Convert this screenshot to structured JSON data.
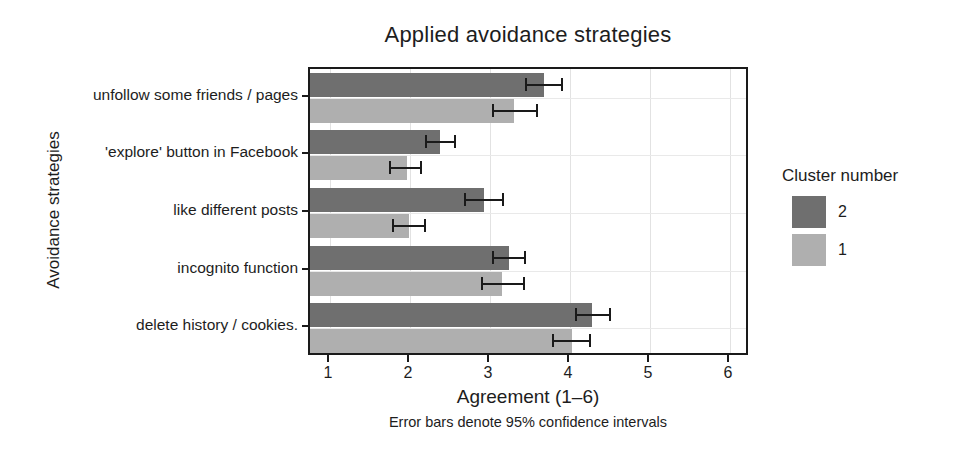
{
  "chart_data": {
    "type": "bar",
    "orientation": "horizontal",
    "title": "Applied avoidance strategies",
    "xlabel": "Agreement (1–6)",
    "ylabel": "Avoidance strategies",
    "caption": "Error bars denote 95% confidence intervals",
    "xlim": [
      1,
      6
    ],
    "xticks": [
      "1",
      "2",
      "3",
      "4",
      "5",
      "6"
    ],
    "grid": true,
    "legend": {
      "title": "Cluster number",
      "position": "right",
      "entries": [
        {
          "label": "2",
          "color": "#6f6f6f"
        },
        {
          "label": "1",
          "color": "#afafaf"
        }
      ]
    },
    "categories": [
      "unfollow some friends / pages",
      "'explore' button in Facebook",
      "like different posts",
      "incognito function",
      "delete history / cookies."
    ],
    "series": [
      {
        "name": "2",
        "color": "#6f6f6f",
        "values": [
          3.68,
          2.38,
          2.93,
          3.24,
          4.28
        ],
        "ci_low": [
          3.44,
          2.19,
          2.68,
          3.03,
          4.06
        ],
        "ci_high": [
          3.89,
          2.55,
          3.15,
          3.43,
          4.49
        ]
      },
      {
        "name": "1",
        "color": "#afafaf",
        "values": [
          3.3,
          1.96,
          1.99,
          3.15,
          4.03
        ],
        "ci_low": [
          3.02,
          1.74,
          1.77,
          2.89,
          3.78
        ],
        "ci_high": [
          3.58,
          2.13,
          2.17,
          3.41,
          4.24
        ]
      }
    ]
  }
}
